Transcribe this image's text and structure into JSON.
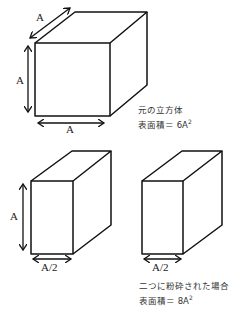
{
  "figure": {
    "original_cube": {
      "dimension_labels": {
        "depth": "A",
        "height": "A",
        "width": "A"
      },
      "caption_line1": "元の立方体",
      "caption_line2_prefix": "表面積＝ 6A",
      "caption_line2_exp": "2"
    },
    "split_blocks": {
      "left_block": {
        "height_label": "A",
        "width_label": "A/2"
      },
      "right_block": {
        "width_label": "A/2"
      },
      "caption_line1": "二つに粉砕された場合",
      "caption_line2_prefix": "表面積＝ 8A",
      "caption_line2_exp": "2"
    },
    "colors": {
      "stroke": "#111111",
      "background": "#ffffff"
    }
  }
}
